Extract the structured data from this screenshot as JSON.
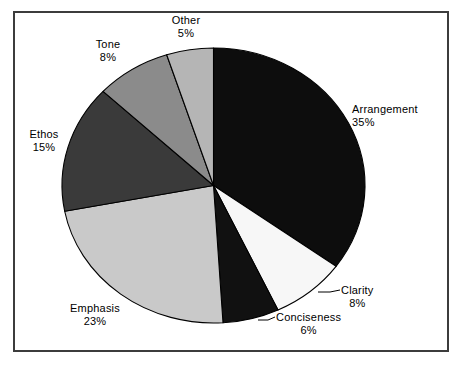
{
  "chart_data": {
    "type": "pie",
    "title": "",
    "subtitle": "",
    "xlabel": "",
    "ylabel": "",
    "legend_position": "none",
    "grid": false,
    "labels_outside": true,
    "value_suffix": "%",
    "categories": [
      "Arrangement",
      "Clarity",
      "Conciseness",
      "Emphasis",
      "Ethos",
      "Tone",
      "Other"
    ],
    "values": [
      35,
      8,
      6,
      23,
      15,
      8,
      5
    ],
    "start_angle_deg": 0,
    "direction": "clockwise",
    "slices": [
      {
        "label": "Arrangement",
        "value": 35,
        "value_text": "35%",
        "color": "#0d0d0d"
      },
      {
        "label": "Clarity",
        "value": 8,
        "value_text": "8%",
        "color": "#f7f7f7"
      },
      {
        "label": "Conciseness",
        "value": 6,
        "value_text": "6%",
        "color": "#111111"
      },
      {
        "label": "Emphasis",
        "value": 23,
        "value_text": "23%",
        "color": "#c9c9c9"
      },
      {
        "label": "Ethos",
        "value": 15,
        "value_text": "15%",
        "color": "#3a3a3a"
      },
      {
        "label": "Tone",
        "value": 8,
        "value_text": "8%",
        "color": "#8b8b8b"
      },
      {
        "label": "Other",
        "value": 5,
        "value_text": "5%",
        "color": "#b5b5b5"
      }
    ]
  },
  "labels": {
    "arrangement": {
      "name": "Arrangement",
      "pct": "35%"
    },
    "clarity": {
      "name": "Clarity",
      "pct": "8%"
    },
    "conciseness": {
      "name": "Conciseness",
      "pct": "6%"
    },
    "emphasis": {
      "name": "Emphasis",
      "pct": "23%"
    },
    "ethos": {
      "name": "Ethos",
      "pct": "15%"
    },
    "tone": {
      "name": "Tone",
      "pct": "8%"
    },
    "other": {
      "name": "Other",
      "pct": "5%"
    }
  },
  "colors": {
    "frame_border": "#3c3c3c",
    "background": "#ffffff",
    "slice_outline": "#000000",
    "text": "#000000"
  }
}
